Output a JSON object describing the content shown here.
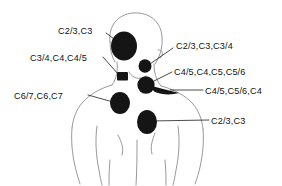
{
  "figure": {
    "background_color": "#ffffff",
    "outline_color": "#8d8d8d",
    "blob_color": "#151515",
    "leader_color": "#2b2b2b"
  },
  "labels": [
    {
      "id": "label-head-lateral",
      "text": "C2/3,C3",
      "anchor": "left",
      "text_x": 58,
      "text_y": 27,
      "region": "lateral head / temporal area"
    },
    {
      "id": "label-neck-lateral",
      "text": "C3/4,C4,C4/5",
      "anchor": "left",
      "text_x": 30,
      "text_y": 54,
      "region": "lateral neck"
    },
    {
      "id": "label-upper-neck-right",
      "text": "C2/3,C3,C3/4",
      "anchor": "right",
      "text_x": 176,
      "text_y": 42,
      "region": "anterior upper neck"
    },
    {
      "id": "label-supraclavicular",
      "text": "C4/5,C4,C5,C5/6",
      "anchor": "right",
      "text_x": 174,
      "text_y": 68,
      "region": "supraclavicular fossa"
    },
    {
      "id": "label-clavicle",
      "text": "C4/5,C5/6,C4",
      "anchor": "right",
      "text_x": 205,
      "text_y": 87,
      "region": "clavicle / trapezius ridge"
    },
    {
      "id": "label-shoulder",
      "text": "C6/7,C6,C7",
      "anchor": "left",
      "text_x": 14,
      "text_y": 92,
      "region": "deltoid / shoulder"
    },
    {
      "id": "label-chest",
      "text": "C2/3,C3",
      "anchor": "right",
      "text_x": 211,
      "text_y": 117,
      "region": "upper chest"
    }
  ],
  "pain_regions": [
    {
      "id": "blob-head",
      "shape": "ellipse",
      "cx": 124,
      "cy": 46,
      "rx": 13,
      "ry": 14
    },
    {
      "id": "blob-neck-square",
      "shape": "rect",
      "x": 117,
      "y": 72,
      "w": 11,
      "h": 8
    },
    {
      "id": "blob-upper-neck-right",
      "shape": "ellipse",
      "cx": 145,
      "cy": 66,
      "rx": 6.5,
      "ry": 6.5
    },
    {
      "id": "blob-supraclavicular",
      "shape": "ellipse",
      "cx": 146,
      "cy": 85,
      "rx": 8.5,
      "ry": 8.5
    },
    {
      "id": "blob-clavicle-crescent",
      "shape": "crescent",
      "cx": 166,
      "cy": 90
    },
    {
      "id": "blob-shoulder",
      "shape": "ellipse",
      "cx": 120,
      "cy": 103,
      "rx": 10,
      "ry": 11
    },
    {
      "id": "blob-chest",
      "shape": "ellipse",
      "cx": 147,
      "cy": 122,
      "rx": 10,
      "ry": 12
    }
  ]
}
